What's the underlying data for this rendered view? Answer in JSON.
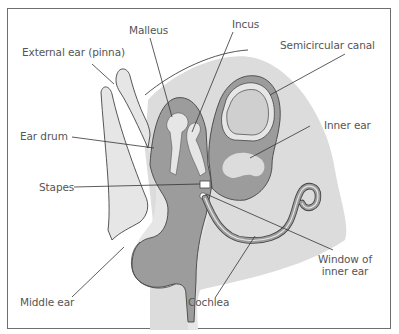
{
  "diagram": {
    "colors": {
      "background": "#ffffff",
      "frame": "#6f6f6f",
      "skull_bg": "#dcdcdc",
      "light_tissue": "#e6e6e6",
      "dark_tissue": "#9c9c9c",
      "mid_tissue": "#c4c4c4",
      "outline": "#444444",
      "leader_line": "#333333",
      "label_text": "#555555"
    },
    "labels": {
      "external_ear": "External ear (pinna)",
      "malleus": "Malleus",
      "incus": "Incus",
      "semicircular_canal": "Semicircular canal",
      "ear_drum": "Ear drum",
      "inner_ear": "Inner ear",
      "stapes": "Stapes",
      "window_line1": "Window of",
      "window_line2": "inner ear",
      "middle_ear": "Middle ear",
      "cochlea": "Cochlea"
    }
  }
}
